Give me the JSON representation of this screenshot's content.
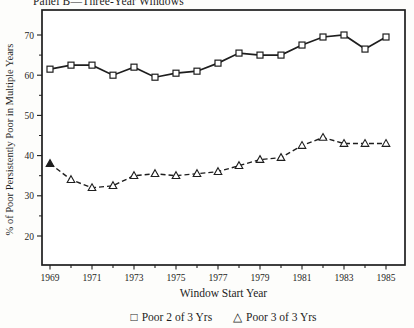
{
  "chart_data": {
    "type": "line",
    "title": "Panel B—Three-Year Windows",
    "xlabel": "Window Start Year",
    "ylabel": "% of Poor Persistently Poor in Multiple Years",
    "grid": false,
    "legend_position": "bottom",
    "ink_color": "#1e1e1e",
    "background_color": "#fdfdfb",
    "x": [
      1969,
      1970,
      1971,
      1972,
      1973,
      1974,
      1975,
      1976,
      1977,
      1978,
      1979,
      1980,
      1981,
      1982,
      1983,
      1984,
      1985
    ],
    "x_tick_labels": [
      1969,
      1971,
      1973,
      1975,
      1977,
      1979,
      1981,
      1983,
      1985
    ],
    "y_ticks": [
      20,
      30,
      40,
      50,
      60,
      70
    ],
    "y_minor_ticks": [
      25,
      35,
      45,
      55,
      65
    ],
    "ylim": [
      13,
      76
    ],
    "series": [
      {
        "name": "Poor 2 of 3 Yrs",
        "marker": "square",
        "line": "solid",
        "values": [
          61.5,
          62.5,
          62.5,
          60,
          62,
          59.5,
          60.5,
          61,
          63,
          65.5,
          65,
          65,
          67.5,
          69.5,
          70,
          66.5,
          69.5
        ]
      },
      {
        "name": "Poor 3 of 3 Yrs",
        "marker": "triangle",
        "line": "dashed",
        "values": [
          38,
          34,
          32,
          32.5,
          35,
          35.5,
          35,
          35.5,
          36,
          37.5,
          39,
          39.5,
          42.5,
          44.5,
          43,
          43,
          43
        ],
        "filled_marker_x": [
          1969
        ]
      }
    ]
  },
  "legend": {
    "square_glyph": "□",
    "triangle_glyph": "△"
  }
}
